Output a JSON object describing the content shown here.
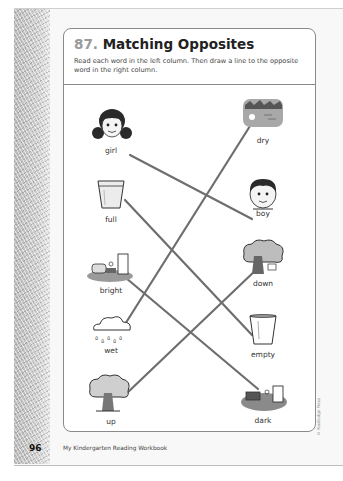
{
  "page": {
    "number": "96",
    "footer": "My Kindergarten Reading Workbook",
    "copyright": "© Routledge Press"
  },
  "worksheet": {
    "number": "87.",
    "title": "Matching Opposites",
    "instructions": "Read each word in the left column. Then draw a line to the opposite word in the right column."
  },
  "left_column": [
    {
      "word": "girl",
      "icon": "girl-face-icon"
    },
    {
      "word": "full",
      "icon": "full-glass-icon"
    },
    {
      "word": "bright",
      "icon": "bright-room-icon"
    },
    {
      "word": "wet",
      "icon": "rain-cloud-icon"
    },
    {
      "word": "up",
      "icon": "tree-up-icon"
    }
  ],
  "right_column": [
    {
      "word": "dry",
      "icon": "dry-landscape-icon"
    },
    {
      "word": "boy",
      "icon": "boy-face-icon"
    },
    {
      "word": "down",
      "icon": "tree-down-icon"
    },
    {
      "word": "empty",
      "icon": "empty-glass-icon"
    },
    {
      "word": "dark",
      "icon": "dark-room-icon"
    }
  ],
  "matches": [
    {
      "from": "girl",
      "to": "boy"
    },
    {
      "from": "full",
      "to": "empty"
    },
    {
      "from": "bright",
      "to": "dark"
    },
    {
      "from": "wet",
      "to": "dry"
    },
    {
      "from": "up",
      "to": "down"
    }
  ],
  "colors": {
    "line": "#6e6e6e",
    "border": "#8a8a8a",
    "number_gray": "#9a9a9a"
  }
}
